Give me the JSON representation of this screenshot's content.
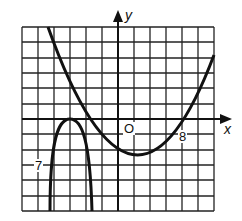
{
  "figure": {
    "x_axis_label": "x",
    "y_axis_label": "y",
    "origin_label": "O",
    "x_tick_label": "8",
    "y_tick_label": "7",
    "grid": {
      "columns": 12,
      "rows": 12
    }
  },
  "curves": [
    {
      "name": "upward-parabola",
      "description": "opens upward, vertex below x-axis right of y-axis, crosses x-axis near the 8 mark"
    },
    {
      "name": "downward-parabola",
      "description": "opens downward, vertex touching x-axis left of y-axis, extends down past the 7 mark"
    }
  ],
  "colors": {
    "ink": "#111111",
    "background": "#ffffff"
  }
}
